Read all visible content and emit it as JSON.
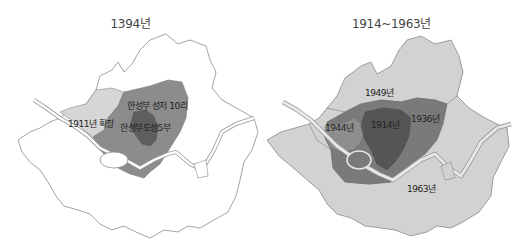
{
  "maps": [
    {
      "title": "1394년",
      "labels": {
        "expansion_1911": "1911년 확장",
        "hanseongbu_10ri": "한성부 성저 10리",
        "hanseongbu_5bu": "한성부도성5부"
      },
      "colors": {
        "background_region": "#ffffff",
        "outline": "#8a8a8a",
        "expansion_1911": "#d6d6d6",
        "hanseongbu_10ri": "#8c8c8c",
        "hanseongbu_5bu": "#5e5e5e",
        "river": "#ffffff"
      }
    },
    {
      "title": "1914~1963년",
      "labels": {
        "y1949": "1949년",
        "y1944": "1944년",
        "y1914": "1914년",
        "y1936": "1936년",
        "y1963": "1963년"
      },
      "colors": {
        "y1963": "#d2d2d2",
        "y1949": "#d2d2d2",
        "y1936": "#7a7a7a",
        "y1944": "#8e8e8e",
        "y1914": "#555555",
        "outline": "#8a8a8a",
        "river": "#e8e8e8"
      }
    }
  ]
}
